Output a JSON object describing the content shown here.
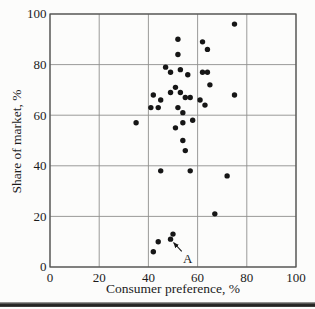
{
  "chart_data": {
    "type": "scatter",
    "xlabel": "Consumer preference, %",
    "ylabel": "Share of market, %",
    "xlim": [
      0,
      100
    ],
    "ylim": [
      0,
      100
    ],
    "xticks": [
      0,
      20,
      40,
      60,
      80,
      100
    ],
    "yticks": [
      0,
      20,
      40,
      60,
      80,
      100
    ],
    "grid": true,
    "legend": "none",
    "marker_color": "#161616",
    "grid_color": "#8f8f8d",
    "border_color": "#4f4f4d",
    "points": [
      [
        75,
        96
      ],
      [
        52,
        90
      ],
      [
        62,
        89
      ],
      [
        64,
        86
      ],
      [
        52,
        84
      ],
      [
        47,
        79
      ],
      [
        49,
        77
      ],
      [
        53,
        78
      ],
      [
        56,
        76
      ],
      [
        62,
        77
      ],
      [
        64,
        77
      ],
      [
        65,
        72
      ],
      [
        51,
        71
      ],
      [
        49,
        69
      ],
      [
        53,
        69
      ],
      [
        42,
        68
      ],
      [
        75,
        68
      ],
      [
        55,
        67
      ],
      [
        57,
        67
      ],
      [
        45,
        66
      ],
      [
        61,
        66
      ],
      [
        63,
        64
      ],
      [
        52,
        63
      ],
      [
        41,
        63
      ],
      [
        44,
        63
      ],
      [
        54,
        61
      ],
      [
        35,
        57
      ],
      [
        51,
        55
      ],
      [
        54,
        57
      ],
      [
        58,
        58
      ],
      [
        54,
        50
      ],
      [
        55,
        46
      ],
      [
        45,
        38
      ],
      [
        57,
        38
      ],
      [
        72,
        36
      ],
      [
        67,
        21
      ],
      [
        50,
        13
      ],
      [
        49,
        11
      ],
      [
        44,
        10
      ],
      [
        42,
        6
      ]
    ],
    "annotation": {
      "label": "A",
      "target_x": 49,
      "target_y": 11,
      "label_x": 56,
      "label_y": 3.5
    }
  }
}
